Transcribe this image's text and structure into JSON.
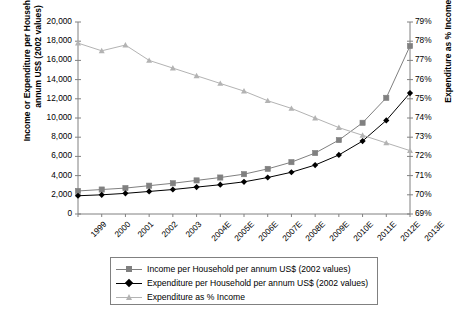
{
  "axes": {
    "left_title": "Income or Expenditure per Household per annum US$ (2002 values)",
    "right_title": "Expenditure as % Income",
    "left_ticks": [
      "20,000",
      "18,000",
      "16,000",
      "14,000",
      "12,000",
      "10,000",
      "8,000",
      "6,000",
      "4,000",
      "2,000",
      "0"
    ],
    "right_ticks": [
      "79%",
      "78%",
      "77%",
      "76%",
      "75%",
      "74%",
      "73%",
      "72%",
      "71%",
      "70%",
      "69%"
    ]
  },
  "legend": {
    "items": [
      {
        "label": "Income per Household per annum US$ (2002 values)",
        "marker": "square-marker",
        "color": "#808080"
      },
      {
        "label": "Expenditure per Household per annum US$ (2002 values)",
        "marker": "diamond-marker",
        "color": "#000000"
      },
      {
        "label": "Expenditure as % Income",
        "marker": "triangle-marker",
        "color": "#b3b3b3"
      }
    ]
  },
  "chart_data": {
    "type": "line",
    "title": "",
    "xlabel": "",
    "ylabel": "Income or Expenditure per Household per annum US$ (2002 values)",
    "y2label": "Expenditure as % Income",
    "categories": [
      "1999",
      "2000",
      "2001",
      "2002",
      "2003",
      "2004E",
      "2005E",
      "2006E",
      "2007E",
      "2008E",
      "2009E",
      "2010E",
      "2011E",
      "2012E",
      "2013E"
    ],
    "ylim": [
      0,
      20000
    ],
    "y2lim": [
      69,
      79
    ],
    "grid": false,
    "legend_position": "bottom",
    "series": [
      {
        "name": "Income per Household per annum US$ (2002 values)",
        "axis": "left",
        "marker": "square",
        "color": "#808080",
        "values": [
          2400,
          2550,
          2700,
          2950,
          3200,
          3500,
          3800,
          4150,
          4700,
          5400,
          6350,
          7700,
          9500,
          12100,
          17500
        ]
      },
      {
        "name": "Expenditure per Household per annum US$ (2002 values)",
        "axis": "left",
        "marker": "diamond",
        "color": "#000000",
        "values": [
          1900,
          2000,
          2150,
          2350,
          2550,
          2800,
          3050,
          3350,
          3800,
          4350,
          5100,
          6150,
          7600,
          9750,
          12600
        ]
      },
      {
        "name": "Expenditure as % Income",
        "axis": "right",
        "marker": "triangle",
        "color": "#b3b3b3",
        "values": [
          77.9,
          77.5,
          77.8,
          77.0,
          76.6,
          76.2,
          75.8,
          75.4,
          74.9,
          74.5,
          74.0,
          73.5,
          73.1,
          72.7,
          72.3
        ]
      }
    ]
  }
}
